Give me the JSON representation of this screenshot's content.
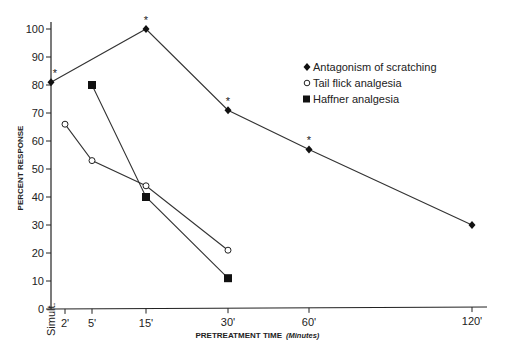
{
  "chart_data": {
    "type": "line",
    "title": "",
    "xlabel": "PRETREATMENT TIME",
    "xlabel_unit": "(Minutes)",
    "ylabel": "PERCENT RESPONSE",
    "ylim": [
      0,
      100
    ],
    "yticks": [
      0,
      10,
      20,
      30,
      40,
      50,
      60,
      70,
      80,
      90,
      100
    ],
    "x_categories": [
      "Simult.",
      "2'",
      "5'",
      "15'",
      "30'",
      "60'",
      "120'"
    ],
    "x_positions_px": {
      "Simult.": 51,
      "2'": 65,
      "5'": 92,
      "15'": 146,
      "30'": 228,
      "60'": 309,
      "120'": 472
    },
    "grid": false,
    "legend_position": "upper right",
    "series": [
      {
        "name": "Antagonism of scratching",
        "marker": "diamond-filled",
        "points": [
          {
            "x": "Simult.",
            "y": 81,
            "significant": true
          },
          {
            "x": "15'",
            "y": 100,
            "significant": true
          },
          {
            "x": "30'",
            "y": 71,
            "significant": true
          },
          {
            "x": "60'",
            "y": 57,
            "significant": true
          },
          {
            "x": "120'",
            "y": 30,
            "significant": false
          }
        ]
      },
      {
        "name": "Tail flick analgesia",
        "marker": "circle-open",
        "points": [
          {
            "x": "2'",
            "y": 66
          },
          {
            "x": "5'",
            "y": 53
          },
          {
            "x": "15'",
            "y": 44
          },
          {
            "x": "30'",
            "y": 21
          }
        ]
      },
      {
        "name": "Haffner analgesia",
        "marker": "square-filled",
        "points": [
          {
            "x": "5'",
            "y": 80
          },
          {
            "x": "15'",
            "y": 40
          },
          {
            "x": "30'",
            "y": 11
          }
        ]
      }
    ],
    "annotations": [
      "* significant marker above points"
    ]
  },
  "legend": {
    "items": [
      {
        "label": "Antagonism of scratching"
      },
      {
        "label": "Tail flick analgesia"
      },
      {
        "label": "Haffner analgesia"
      }
    ]
  },
  "axes": {
    "y_labels": [
      "0",
      "10",
      "20",
      "30",
      "40",
      "50",
      "60",
      "70",
      "80",
      "90",
      "100"
    ],
    "x_labels": [
      "Simult.",
      "2'",
      "5'",
      "15'",
      "30'",
      "60'",
      "120'"
    ],
    "xlabel": "PRETREATMENT TIME",
    "xlabel_unit": "(Minutes)",
    "ylabel": "PERCENT RESPONSE"
  },
  "star_symbol": "*"
}
